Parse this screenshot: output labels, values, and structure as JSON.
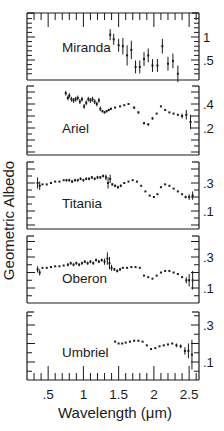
{
  "chart_data": {
    "type": "scatter",
    "title": "",
    "xlabel": "Wavelength (μm)",
    "ylabel": "Geometric Albedo",
    "xlim": [
      0.2,
      2.64
    ],
    "x_ticks": [
      0.5,
      1,
      1.5,
      2,
      2.5
    ],
    "x_tick_labels": [
      ".5",
      "1",
      "1.5",
      "2",
      "2.5"
    ],
    "grid": false,
    "legend": null,
    "panels": [
      {
        "name": "Miranda",
        "box": [
          13,
          80
        ],
        "yref": [
          [
            1.0,
            37
          ],
          [
            0.5,
            60
          ]
        ],
        "y_tick_labels": [
          {
            "v": 1.0,
            "label": "1"
          },
          {
            "v": 0.5,
            "label": ".5"
          }
        ],
        "label_pos": [
          62,
          52
        ],
        "series": [
          {
            "x": 1.38,
            "y": 1.05,
            "err": 0.12
          },
          {
            "x": 1.43,
            "y": 0.95,
            "err": 0.12
          },
          {
            "x": 1.5,
            "y": 0.82,
            "err": 0.14
          },
          {
            "x": 1.56,
            "y": 0.8,
            "err": 0.18
          },
          {
            "x": 1.62,
            "y": 0.6,
            "err": 0.22
          },
          {
            "x": 1.68,
            "y": 0.72,
            "err": 0.2
          },
          {
            "x": 1.74,
            "y": 0.35,
            "err": 0.14
          },
          {
            "x": 1.8,
            "y": 0.35,
            "err": 0.14
          },
          {
            "x": 1.86,
            "y": 0.52,
            "err": 0.15
          },
          {
            "x": 1.92,
            "y": 0.6,
            "err": 0.15
          },
          {
            "x": 1.98,
            "y": 0.38,
            "err": 0.14
          },
          {
            "x": 2.05,
            "y": 0.38,
            "err": 0.14
          },
          {
            "x": 2.12,
            "y": 0.8,
            "err": 0.16
          },
          {
            "x": 2.2,
            "y": 0.42,
            "err": 0.15
          },
          {
            "x": 2.27,
            "y": 0.48,
            "err": 0.16
          },
          {
            "x": 2.34,
            "y": 0.2,
            "err": 0.18
          }
        ]
      },
      {
        "name": "Ariel",
        "box": [
          86,
          155
        ],
        "yref": [
          [
            0.4,
            104
          ],
          [
            0.2,
            128
          ]
        ],
        "y_tick_labels": [
          {
            "v": 0.4,
            "label": ".4"
          },
          {
            "v": 0.2,
            "label": ".2"
          }
        ],
        "label_pos": [
          62,
          133
        ],
        "series": [
          {
            "x": 0.75,
            "y": 0.49,
            "err": 0.02
          },
          {
            "x": 0.78,
            "y": 0.45,
            "err": 0.02
          },
          {
            "x": 0.8,
            "y": 0.47,
            "err": 0.02
          },
          {
            "x": 0.83,
            "y": 0.44,
            "err": 0.02
          },
          {
            "x": 0.86,
            "y": 0.43,
            "err": 0.02
          },
          {
            "x": 0.89,
            "y": 0.44,
            "err": 0.02
          },
          {
            "x": 0.92,
            "y": 0.45,
            "err": 0.02
          },
          {
            "x": 0.95,
            "y": 0.42,
            "err": 0.02
          },
          {
            "x": 0.98,
            "y": 0.44,
            "err": 0.02
          },
          {
            "x": 1.01,
            "y": 0.38,
            "err": 0.02
          },
          {
            "x": 1.04,
            "y": 0.41,
            "err": 0.02
          },
          {
            "x": 1.07,
            "y": 0.44,
            "err": 0.02
          },
          {
            "x": 1.1,
            "y": 0.43,
            "err": 0.02
          },
          {
            "x": 1.13,
            "y": 0.44,
            "err": 0.02
          },
          {
            "x": 1.16,
            "y": 0.42,
            "err": 0.02
          },
          {
            "x": 1.19,
            "y": 0.4,
            "err": 0.02
          },
          {
            "x": 1.22,
            "y": 0.43,
            "err": 0.02
          },
          {
            "x": 1.24,
            "y": 0.36,
            "err": 0.02
          },
          {
            "x": 1.27,
            "y": 0.34,
            "err": 0.01
          },
          {
            "x": 1.3,
            "y": 0.33,
            "err": 0.01
          },
          {
            "x": 1.33,
            "y": 0.34,
            "err": 0.01
          },
          {
            "x": 1.36,
            "y": 0.35,
            "err": 0.01
          },
          {
            "x": 1.39,
            "y": 0.36,
            "err": 0.01
          },
          {
            "x": 1.45,
            "y": 0.37,
            "err": 0.0
          },
          {
            "x": 1.52,
            "y": 0.38,
            "err": 0.0
          },
          {
            "x": 1.58,
            "y": 0.39,
            "err": 0.0
          },
          {
            "x": 1.64,
            "y": 0.4,
            "err": 0.0
          },
          {
            "x": 1.72,
            "y": 0.37,
            "err": 0.01
          },
          {
            "x": 1.78,
            "y": 0.33,
            "err": 0.01
          },
          {
            "x": 1.86,
            "y": 0.24,
            "err": 0.01
          },
          {
            "x": 1.92,
            "y": 0.23,
            "err": 0.01
          },
          {
            "x": 1.98,
            "y": 0.28,
            "err": 0.01
          },
          {
            "x": 2.04,
            "y": 0.32,
            "err": 0.0
          },
          {
            "x": 2.1,
            "y": 0.38,
            "err": 0.0
          },
          {
            "x": 2.16,
            "y": 0.35,
            "err": 0.0
          },
          {
            "x": 2.22,
            "y": 0.33,
            "err": 0.0
          },
          {
            "x": 2.28,
            "y": 0.32,
            "err": 0.0
          },
          {
            "x": 2.34,
            "y": 0.31,
            "err": 0.0
          },
          {
            "x": 2.4,
            "y": 0.3,
            "err": 0.02
          },
          {
            "x": 2.46,
            "y": 0.31,
            "err": 0.04
          },
          {
            "x": 2.52,
            "y": 0.25,
            "err": 0.06
          }
        ]
      },
      {
        "name": "Titania",
        "box": [
          162,
          229
        ],
        "yref": [
          [
            0.3,
            183
          ],
          [
            0.1,
            211
          ]
        ],
        "y_tick_labels": [
          {
            "v": 0.3,
            "label": ".3"
          },
          {
            "v": 0.1,
            "label": ".1"
          }
        ],
        "label_pos": [
          62,
          208
        ],
        "series": [
          {
            "x": 0.35,
            "y": 0.3,
            "err": 0.04
          },
          {
            "x": 0.38,
            "y": 0.28,
            "err": 0.03
          },
          {
            "x": 0.42,
            "y": 0.29,
            "err": 0.0
          },
          {
            "x": 0.48,
            "y": 0.29,
            "err": 0.0
          },
          {
            "x": 0.54,
            "y": 0.3,
            "err": 0.0
          },
          {
            "x": 0.6,
            "y": 0.31,
            "err": 0.0
          },
          {
            "x": 0.66,
            "y": 0.31,
            "err": 0.0
          },
          {
            "x": 0.72,
            "y": 0.32,
            "err": 0.0
          },
          {
            "x": 0.76,
            "y": 0.32,
            "err": 0.01
          },
          {
            "x": 0.8,
            "y": 0.32,
            "err": 0.01
          },
          {
            "x": 0.84,
            "y": 0.31,
            "err": 0.01
          },
          {
            "x": 0.88,
            "y": 0.32,
            "err": 0.01
          },
          {
            "x": 0.92,
            "y": 0.32,
            "err": 0.01
          },
          {
            "x": 0.96,
            "y": 0.33,
            "err": 0.01
          },
          {
            "x": 1.0,
            "y": 0.32,
            "err": 0.01
          },
          {
            "x": 1.04,
            "y": 0.33,
            "err": 0.01
          },
          {
            "x": 1.08,
            "y": 0.33,
            "err": 0.01
          },
          {
            "x": 1.12,
            "y": 0.34,
            "err": 0.01
          },
          {
            "x": 1.16,
            "y": 0.33,
            "err": 0.01
          },
          {
            "x": 1.2,
            "y": 0.34,
            "err": 0.01
          },
          {
            "x": 1.24,
            "y": 0.34,
            "err": 0.01
          },
          {
            "x": 1.28,
            "y": 0.35,
            "err": 0.01
          },
          {
            "x": 1.32,
            "y": 0.34,
            "err": 0.02
          },
          {
            "x": 1.35,
            "y": 0.3,
            "err": 0.04
          },
          {
            "x": 1.38,
            "y": 0.33,
            "err": 0.03
          },
          {
            "x": 1.41,
            "y": 0.29,
            "err": 0.01
          },
          {
            "x": 1.45,
            "y": 0.28,
            "err": 0.01
          },
          {
            "x": 1.49,
            "y": 0.27,
            "err": 0.01
          },
          {
            "x": 1.53,
            "y": 0.28,
            "err": 0.01
          },
          {
            "x": 1.58,
            "y": 0.3,
            "err": 0.0
          },
          {
            "x": 1.64,
            "y": 0.31,
            "err": 0.0
          },
          {
            "x": 1.7,
            "y": 0.32,
            "err": 0.0
          },
          {
            "x": 1.76,
            "y": 0.31,
            "err": 0.0
          },
          {
            "x": 1.82,
            "y": 0.28,
            "err": 0.0
          },
          {
            "x": 1.88,
            "y": 0.24,
            "err": 0.0
          },
          {
            "x": 1.94,
            "y": 0.21,
            "err": 0.0
          },
          {
            "x": 2.0,
            "y": 0.2,
            "err": 0.0
          },
          {
            "x": 2.05,
            "y": 0.22,
            "err": 0.0
          },
          {
            "x": 2.1,
            "y": 0.27,
            "err": 0.0
          },
          {
            "x": 2.16,
            "y": 0.29,
            "err": 0.0
          },
          {
            "x": 2.22,
            "y": 0.28,
            "err": 0.0
          },
          {
            "x": 2.28,
            "y": 0.26,
            "err": 0.0
          },
          {
            "x": 2.34,
            "y": 0.24,
            "err": 0.0
          },
          {
            "x": 2.4,
            "y": 0.22,
            "err": 0.0
          },
          {
            "x": 2.45,
            "y": 0.2,
            "err": 0.01
          },
          {
            "x": 2.5,
            "y": 0.2,
            "err": 0.02
          },
          {
            "x": 2.55,
            "y": 0.21,
            "err": 0.03
          }
        ]
      },
      {
        "name": "Oberon",
        "box": [
          236,
          303
        ],
        "yref": [
          [
            0.3,
            257
          ],
          [
            0.1,
            288
          ]
        ],
        "y_tick_labels": [
          {
            "v": 0.3,
            "label": ".3"
          },
          {
            "v": 0.1,
            "label": ".1"
          }
        ],
        "label_pos": [
          62,
          283
        ],
        "series": [
          {
            "x": 0.35,
            "y": 0.22,
            "err": 0.02
          },
          {
            "x": 0.38,
            "y": 0.2,
            "err": 0.02
          },
          {
            "x": 0.42,
            "y": 0.23,
            "err": 0.0
          },
          {
            "x": 0.48,
            "y": 0.23,
            "err": 0.0
          },
          {
            "x": 0.54,
            "y": 0.235,
            "err": 0.0
          },
          {
            "x": 0.6,
            "y": 0.24,
            "err": 0.0
          },
          {
            "x": 0.66,
            "y": 0.24,
            "err": 0.0
          },
          {
            "x": 0.72,
            "y": 0.245,
            "err": 0.0
          },
          {
            "x": 0.78,
            "y": 0.25,
            "err": 0.01
          },
          {
            "x": 0.82,
            "y": 0.26,
            "err": 0.01
          },
          {
            "x": 0.86,
            "y": 0.25,
            "err": 0.01
          },
          {
            "x": 0.9,
            "y": 0.26,
            "err": 0.01
          },
          {
            "x": 0.94,
            "y": 0.25,
            "err": 0.01
          },
          {
            "x": 0.98,
            "y": 0.26,
            "err": 0.01
          },
          {
            "x": 1.02,
            "y": 0.27,
            "err": 0.01
          },
          {
            "x": 1.06,
            "y": 0.26,
            "err": 0.01
          },
          {
            "x": 1.1,
            "y": 0.27,
            "err": 0.01
          },
          {
            "x": 1.14,
            "y": 0.26,
            "err": 0.01
          },
          {
            "x": 1.18,
            "y": 0.28,
            "err": 0.01
          },
          {
            "x": 1.22,
            "y": 0.27,
            "err": 0.01
          },
          {
            "x": 1.26,
            "y": 0.28,
            "err": 0.01
          },
          {
            "x": 1.3,
            "y": 0.27,
            "err": 0.02
          },
          {
            "x": 1.34,
            "y": 0.29,
            "err": 0.04
          },
          {
            "x": 1.37,
            "y": 0.26,
            "err": 0.04
          },
          {
            "x": 1.4,
            "y": 0.23,
            "err": 0.02
          },
          {
            "x": 1.44,
            "y": 0.22,
            "err": 0.01
          },
          {
            "x": 1.48,
            "y": 0.21,
            "err": 0.01
          },
          {
            "x": 1.52,
            "y": 0.22,
            "err": 0.01
          },
          {
            "x": 1.56,
            "y": 0.23,
            "err": 0.0
          },
          {
            "x": 1.62,
            "y": 0.23,
            "err": 0.0
          },
          {
            "x": 1.68,
            "y": 0.235,
            "err": 0.0
          },
          {
            "x": 1.74,
            "y": 0.235,
            "err": 0.0
          },
          {
            "x": 1.8,
            "y": 0.23,
            "err": 0.0
          },
          {
            "x": 1.86,
            "y": 0.18,
            "err": 0.0
          },
          {
            "x": 1.92,
            "y": 0.17,
            "err": 0.0
          },
          {
            "x": 1.98,
            "y": 0.16,
            "err": 0.0
          },
          {
            "x": 2.04,
            "y": 0.18,
            "err": 0.0
          },
          {
            "x": 2.1,
            "y": 0.2,
            "err": 0.0
          },
          {
            "x": 2.16,
            "y": 0.21,
            "err": 0.0
          },
          {
            "x": 2.22,
            "y": 0.21,
            "err": 0.0
          },
          {
            "x": 2.28,
            "y": 0.2,
            "err": 0.0
          },
          {
            "x": 2.34,
            "y": 0.19,
            "err": 0.0
          },
          {
            "x": 2.4,
            "y": 0.17,
            "err": 0.0
          },
          {
            "x": 2.46,
            "y": 0.15,
            "err": 0.02
          },
          {
            "x": 2.5,
            "y": 0.15,
            "err": 0.04
          },
          {
            "x": 2.55,
            "y": 0.15,
            "err": 0.06
          }
        ]
      },
      {
        "name": "Umbriel",
        "box": [
          312,
          380
        ],
        "yref": [
          [
            0.3,
            325
          ],
          [
            0.1,
            362
          ]
        ],
        "y_tick_labels": [
          {
            "v": 0.3,
            "label": ".3"
          },
          {
            "v": 0.1,
            "label": ".1"
          }
        ],
        "label_pos": [
          62,
          357
        ],
        "series": [
          {
            "x": 1.45,
            "y": 0.21,
            "err": 0.0
          },
          {
            "x": 1.5,
            "y": 0.2,
            "err": 0.0
          },
          {
            "x": 1.55,
            "y": 0.2,
            "err": 0.0
          },
          {
            "x": 1.6,
            "y": 0.205,
            "err": 0.0
          },
          {
            "x": 1.66,
            "y": 0.21,
            "err": 0.0
          },
          {
            "x": 1.72,
            "y": 0.215,
            "err": 0.0
          },
          {
            "x": 1.78,
            "y": 0.215,
            "err": 0.0
          },
          {
            "x": 1.84,
            "y": 0.21,
            "err": 0.0
          },
          {
            "x": 1.9,
            "y": 0.19,
            "err": 0.0
          },
          {
            "x": 1.96,
            "y": 0.17,
            "err": 0.0
          },
          {
            "x": 2.02,
            "y": 0.175,
            "err": 0.0
          },
          {
            "x": 2.08,
            "y": 0.185,
            "err": 0.0
          },
          {
            "x": 2.14,
            "y": 0.19,
            "err": 0.0
          },
          {
            "x": 2.2,
            "y": 0.195,
            "err": 0.0
          },
          {
            "x": 2.26,
            "y": 0.2,
            "err": 0.0
          },
          {
            "x": 2.32,
            "y": 0.19,
            "err": 0.01
          },
          {
            "x": 2.38,
            "y": 0.185,
            "err": 0.01
          },
          {
            "x": 2.44,
            "y": 0.16,
            "err": 0.02
          },
          {
            "x": 2.49,
            "y": 0.16,
            "err": 0.04
          },
          {
            "x": 2.54,
            "y": 0.14,
            "err": 0.08
          }
        ]
      }
    ]
  }
}
